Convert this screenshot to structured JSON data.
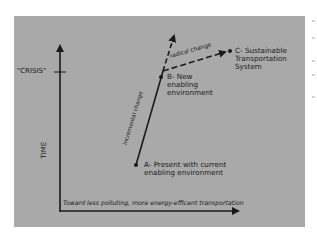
{
  "diagram": {
    "background_color": "#a9a9a9",
    "line_color": "#1a1a1a",
    "axes": {
      "y_label": "TIME",
      "x_label": "Toward less polluting, more energy-efficent transportation",
      "y_marker": "\"CRISIS\""
    },
    "nodes": {
      "a": {
        "label_line1": "A- Present with current",
        "label_line2": "enabling environment"
      },
      "b": {
        "label_line1": "B- New",
        "label_line2": "enabling",
        "label_line3": "environment"
      },
      "c": {
        "label_line1": "C- Sustainable",
        "label_line2": "Transportation",
        "label_line3": "System"
      }
    },
    "edges": {
      "a_to_b": "incremental change",
      "b_to_c": "radical change"
    }
  }
}
